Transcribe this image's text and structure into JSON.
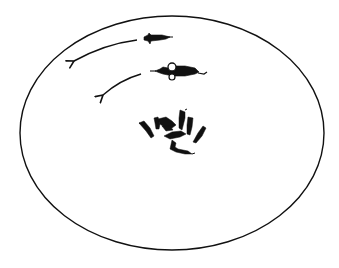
{
  "figure": {
    "description": "Line drawing of a circular/oval arena with two animals moving along curved arrows and a huddled cluster of animals near the center",
    "colors": {
      "background": "#ffffff",
      "ink": "#111111"
    },
    "arena": {
      "cx": 172,
      "cy": 133,
      "rx": 152,
      "ry": 117
    },
    "arrows": [
      {
        "id": "arrow-upper",
        "path": "M137,40 Q105,44 74,61"
      },
      {
        "id": "arrow-lower",
        "path": "M141,74 Q120,80 103,95"
      }
    ],
    "moving_animals": [
      {
        "id": "animal-upper",
        "x": 143,
        "y": 38
      },
      {
        "id": "animal-lower-with-loop",
        "x": 150,
        "y": 71
      }
    ],
    "cluster": {
      "count": 9,
      "center_x": 172,
      "center_y": 132
    }
  }
}
